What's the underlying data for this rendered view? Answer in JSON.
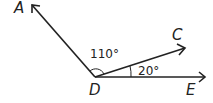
{
  "diagram": {
    "type": "angle-diagram",
    "vertex": {
      "label": "D"
    },
    "rays": [
      {
        "label": "A"
      },
      {
        "label": "C"
      },
      {
        "label": "E"
      }
    ],
    "angles": [
      {
        "between": "ADC",
        "value": "110°"
      },
      {
        "between": "CDE",
        "value": "20°"
      }
    ],
    "colors": {
      "stroke": "#222222",
      "background": "#ffffff"
    }
  }
}
